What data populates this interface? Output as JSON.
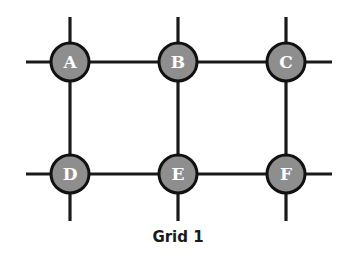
{
  "diagram": {
    "caption": "Grid 1",
    "colors": {
      "line": "#1a1a1a",
      "node_fill": "#8e8e8e",
      "node_stroke": "#111111",
      "label": "#ffffff"
    },
    "node_radius": 19,
    "line_extents": {
      "x_min": 26,
      "x_max": 332,
      "y_min": 17,
      "y_max": 221
    },
    "nodes": [
      {
        "id": "A",
        "label": "A",
        "x": 70,
        "y": 62
      },
      {
        "id": "B",
        "label": "B",
        "x": 178,
        "y": 62
      },
      {
        "id": "C",
        "label": "C",
        "x": 286,
        "y": 62
      },
      {
        "id": "D",
        "label": "D",
        "x": 70,
        "y": 174
      },
      {
        "id": "E",
        "label": "E",
        "x": 178,
        "y": 174
      },
      {
        "id": "F",
        "label": "F",
        "x": 286,
        "y": 174
      }
    ],
    "edges": [
      [
        "A",
        "B"
      ],
      [
        "B",
        "C"
      ],
      [
        "D",
        "E"
      ],
      [
        "E",
        "F"
      ],
      [
        "A",
        "D"
      ],
      [
        "B",
        "E"
      ],
      [
        "C",
        "F"
      ]
    ]
  }
}
